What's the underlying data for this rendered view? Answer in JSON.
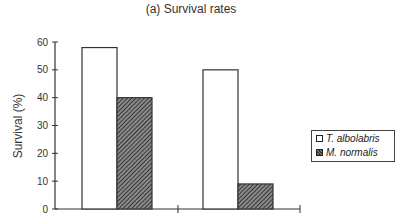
{
  "chart_data": {
    "type": "bar",
    "title": "(a) Survival rates",
    "xlabel": "",
    "ylabel": "Survival (%)",
    "ylim": [
      0,
      60
    ],
    "yticks": [
      0,
      10,
      20,
      30,
      40,
      50,
      60
    ],
    "categories": [
      "",
      ""
    ],
    "series": [
      {
        "name": "T. albolabris",
        "fill": "white",
        "values": [
          58,
          50
        ]
      },
      {
        "name": "M. normalis",
        "fill": "hatched",
        "values": [
          40,
          9
        ]
      }
    ],
    "grid": false,
    "legend_position": "right"
  },
  "legend": {
    "items": [
      {
        "label": "T. albolabris"
      },
      {
        "label": "M. normalis"
      }
    ]
  },
  "colors": {
    "axis": "#333333",
    "bar_outline": "#333333",
    "white_fill": "#ffffff",
    "hatch_fill": "#555555"
  }
}
